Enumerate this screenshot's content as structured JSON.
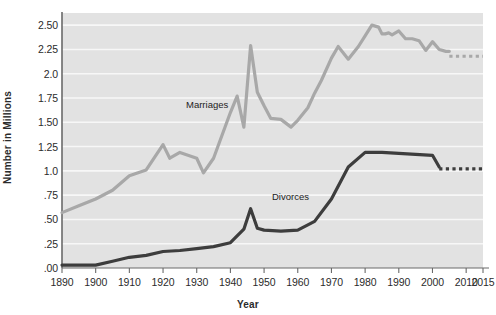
{
  "chart_data": {
    "type": "line",
    "title": "",
    "xlabel": "Year",
    "ylabel": "Number in Millions",
    "xlim": [
      1890,
      2015
    ],
    "ylim": [
      0.0,
      2.625
    ],
    "grid": true,
    "grid_axis": "y",
    "legend_position": "inline-annotation",
    "xtick_labels": [
      "1890",
      "1900",
      "1910",
      "1920",
      "1930",
      "1940",
      "1950",
      "1960",
      "1970",
      "1980",
      "1990",
      "2000",
      "2010",
      "2015"
    ],
    "xtick_values": [
      1890,
      1900,
      1910,
      1920,
      1930,
      1940,
      1950,
      1960,
      1970,
      1980,
      1990,
      2000,
      2010,
      2015
    ],
    "ytick_labels": [
      ".00",
      ".25",
      ".50",
      ".75",
      "1.0",
      "1.25",
      "1.50",
      "1.75",
      "2.0",
      "2.25",
      "2.50"
    ],
    "ytick_values": [
      0.0,
      0.25,
      0.5,
      0.75,
      1.0,
      1.25,
      1.5,
      1.75,
      2.0,
      2.25,
      2.5
    ],
    "series": [
      {
        "name": "Marriages",
        "color": "#a8a8a8",
        "label_text": "Marriages",
        "x": [
          1890,
          1895,
          1900,
          1905,
          1910,
          1915,
          1920,
          1922,
          1925,
          1930,
          1932,
          1935,
          1940,
          1942,
          1944,
          1946,
          1948,
          1950,
          1952,
          1955,
          1958,
          1960,
          1963,
          1965,
          1967,
          1970,
          1972,
          1975,
          1978,
          1980,
          1982,
          1984,
          1985,
          1986,
          1987,
          1988,
          1990,
          1992,
          1994,
          1996,
          1998,
          2000,
          2002,
          2004,
          2005
        ],
        "values": [
          0.57,
          0.64,
          0.71,
          0.8,
          0.95,
          1.01,
          1.27,
          1.13,
          1.19,
          1.13,
          0.98,
          1.13,
          1.6,
          1.77,
          1.45,
          2.29,
          1.81,
          1.67,
          1.54,
          1.53,
          1.45,
          1.52,
          1.65,
          1.8,
          1.93,
          2.16,
          2.28,
          2.15,
          2.28,
          2.39,
          2.5,
          2.48,
          2.41,
          2.41,
          2.42,
          2.4,
          2.44,
          2.36,
          2.36,
          2.34,
          2.24,
          2.33,
          2.25,
          2.23,
          2.23
        ],
        "projection_x": [
          2005,
          2015
        ],
        "projection_values": [
          2.18,
          2.18
        ],
        "projection_style": "dotted"
      },
      {
        "name": "Divorces",
        "color": "#3d3d3d",
        "label_text": "Divorces",
        "x": [
          1890,
          1895,
          1900,
          1905,
          1910,
          1915,
          1920,
          1925,
          1930,
          1935,
          1940,
          1944,
          1946,
          1948,
          1950,
          1955,
          1960,
          1965,
          1970,
          1975,
          1980,
          1985,
          1990,
          1995,
          2000,
          2002
        ],
        "values": [
          0.03,
          0.03,
          0.03,
          0.07,
          0.11,
          0.13,
          0.17,
          0.18,
          0.2,
          0.22,
          0.26,
          0.4,
          0.61,
          0.41,
          0.39,
          0.38,
          0.39,
          0.48,
          0.71,
          1.04,
          1.19,
          1.19,
          1.18,
          1.17,
          1.16,
          1.04
        ],
        "projection_x": [
          2002,
          2015
        ],
        "projection_values": [
          1.02,
          1.02
        ],
        "projection_style": "dotted"
      }
    ],
    "plot_area": {
      "left": 62,
      "top": 13,
      "right": 483,
      "bottom": 268,
      "background": "#e2e2e2",
      "gridline_color": "#f7f7f7",
      "axis_color": "#6a6a6a"
    }
  }
}
